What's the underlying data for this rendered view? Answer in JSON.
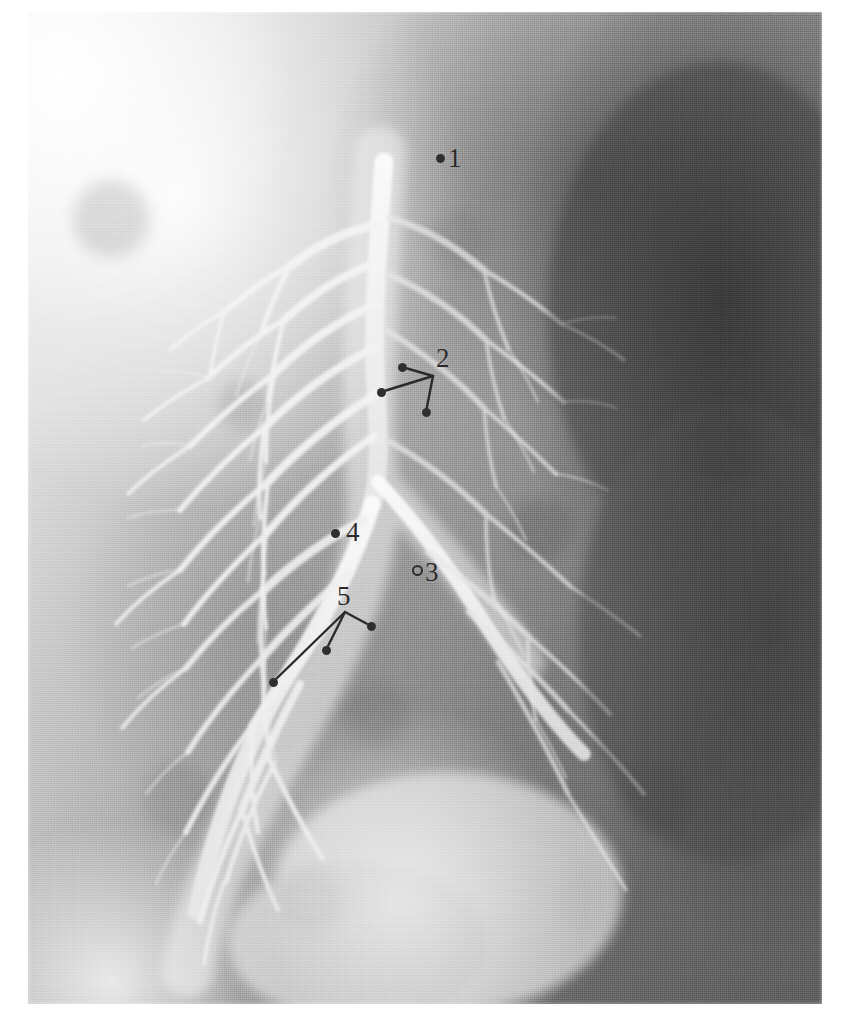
{
  "figure": {
    "kind": "radiograph",
    "modality": "bronchogram",
    "plate": {
      "left": 28,
      "top": 12,
      "width": 794,
      "height": 992,
      "background_hex": "#8d8d8d",
      "paper_hex": "#ffffff",
      "ink_hex": "#2a2a2a",
      "dot_hex": "#2f2f2f"
    }
  },
  "annotations": {
    "labels": [
      {
        "id": "1",
        "text": "1",
        "label_x": 448,
        "label_y": 145,
        "dots": [
          {
            "x": 440,
            "y": 158,
            "style": "filled"
          }
        ],
        "leaders": [],
        "vertex": null
      },
      {
        "id": "2",
        "text": "2",
        "label_x": 436,
        "label_y": 345,
        "vertex": {
          "x": 433,
          "y": 376
        },
        "dots": [
          {
            "x": 402,
            "y": 367,
            "style": "filled"
          },
          {
            "x": 381,
            "y": 392,
            "style": "filled"
          },
          {
            "x": 426,
            "y": 412,
            "style": "filled"
          }
        ],
        "leaders": [
          {
            "x1": 433,
            "y1": 376,
            "x2": 402,
            "y2": 367
          },
          {
            "x1": 433,
            "y1": 376,
            "x2": 381,
            "y2": 392
          },
          {
            "x1": 433,
            "y1": 376,
            "x2": 426,
            "y2": 412
          }
        ]
      },
      {
        "id": "3",
        "text": "3",
        "label_x": 425,
        "label_y": 559,
        "dots": [
          {
            "x": 417,
            "y": 570,
            "style": "hollow"
          }
        ],
        "leaders": [],
        "vertex": null
      },
      {
        "id": "4",
        "text": "4",
        "label_x": 346,
        "label_y": 519,
        "dots": [
          {
            "x": 335,
            "y": 533,
            "style": "filled"
          }
        ],
        "leaders": [],
        "vertex": null
      },
      {
        "id": "5",
        "text": "5",
        "label_x": 337,
        "label_y": 583,
        "vertex": {
          "x": 345,
          "y": 612
        },
        "dots": [
          {
            "x": 371,
            "y": 626,
            "style": "filled"
          },
          {
            "x": 326,
            "y": 650,
            "style": "filled"
          },
          {
            "x": 273,
            "y": 682,
            "style": "filled"
          }
        ],
        "leaders": [
          {
            "x1": 345,
            "y1": 612,
            "x2": 371,
            "y2": 626
          },
          {
            "x1": 345,
            "y1": 612,
            "x2": 326,
            "y2": 650
          },
          {
            "x1": 345,
            "y1": 612,
            "x2": 273,
            "y2": 682
          }
        ]
      }
    ]
  }
}
